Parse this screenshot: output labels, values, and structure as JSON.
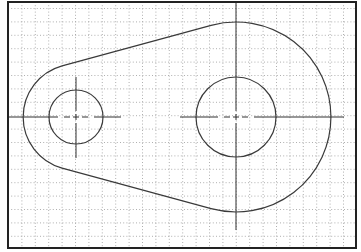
{
  "drawing": {
    "type": "cad-sketch",
    "description": "Link plate with two holes connected by tangent lines on dotted grid",
    "colors": {
      "background": "#ffffff",
      "border": "#222222",
      "outline": "#3a3a3a",
      "grid": "#9a9a9a",
      "centerline": "#333333"
    },
    "frame": {
      "x": 8,
      "y": 2,
      "width": 348,
      "height": 246
    },
    "grid": {
      "spacing": 13.4,
      "origin_x": 8.5,
      "origin_y": 8.5
    },
    "small_end": {
      "cx": 76,
      "cy": 117,
      "hole_r": 27,
      "outer_r": 53
    },
    "large_end": {
      "cx": 236,
      "cy": 117,
      "hole_r": 40,
      "outer_r": 95
    },
    "tangent_top": {
      "x1": 62.1,
      "y1": 65.9,
      "x2": 211.1,
      "y2": 25.3
    },
    "tangent_bottom": {
      "x1": 62.1,
      "y1": 168.1,
      "x2": 211.1,
      "y2": 208.7
    }
  }
}
